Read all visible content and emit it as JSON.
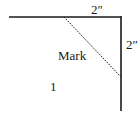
{
  "diagram": {
    "labels": {
      "top_dimension": "2″",
      "right_dimension": "2″",
      "mark": "Mark",
      "region": "1"
    },
    "colors": {
      "line": "#1a1a1a",
      "background": "#ffffff"
    },
    "geometry": {
      "horizontal_edge": {
        "x1": 9,
        "y1": 17,
        "x2": 121,
        "y2": 17
      },
      "vertical_edge": {
        "x1": 121,
        "y1": 17,
        "x2": 121,
        "y2": 111
      },
      "diagonal_mark": {
        "x1": 64,
        "y1": 17,
        "x2": 121,
        "y2": 77,
        "style": "dotted"
      }
    }
  }
}
